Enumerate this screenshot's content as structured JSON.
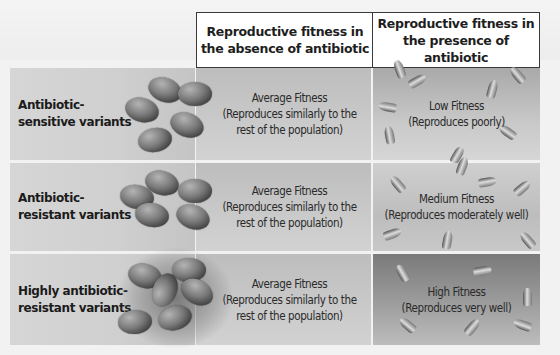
{
  "columns": {
    "absence": "Reproductive fitness in the absence of antibiotic",
    "presence": "Reproductive fitness in the presence of antibiotic"
  },
  "rows": [
    {
      "label_line1": "Antibiotic-",
      "label_line2": "sensitive variants",
      "absence_title": "Average Fitness",
      "absence_desc_line1": "(Reproduces similarly to the",
      "absence_desc_line2": "rest of the population)",
      "presence_title": "Low Fitness",
      "presence_desc": "(Reproduces poorly)"
    },
    {
      "label_line1": "Antibiotic-",
      "label_line2": "resistant variants",
      "absence_title": "Average Fitness",
      "absence_desc_line1": "(Reproduces similarly to the",
      "absence_desc_line2": "rest of the population)",
      "presence_title": "Medium Fitness",
      "presence_desc": "(Reproduces moderately well)"
    },
    {
      "label_line1": "Highly antibiotic-",
      "label_line2": "resistant variants",
      "absence_title": "Average Fitness",
      "absence_desc_line1": "(Reproduces similarly to the",
      "absence_desc_line2": "rest of the population)",
      "presence_title": "High Fitness",
      "presence_desc": "(Reproduces very well)"
    }
  ],
  "icons": {
    "bacteria": "bacteria-cluster-icon",
    "antibiotic": "antibiotic-capsule-icon"
  }
}
